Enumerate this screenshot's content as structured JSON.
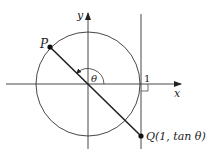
{
  "diagram": {
    "axes": {
      "x_label": "x",
      "y_label": "y"
    },
    "points": {
      "P": {
        "label": "P"
      },
      "Q": {
        "label": "Q(1, tan θ)"
      }
    },
    "angle_label": "θ",
    "tick_label": "1",
    "colors": {
      "stroke": "#333333",
      "thick": "#222222",
      "point": "#111111"
    }
  }
}
